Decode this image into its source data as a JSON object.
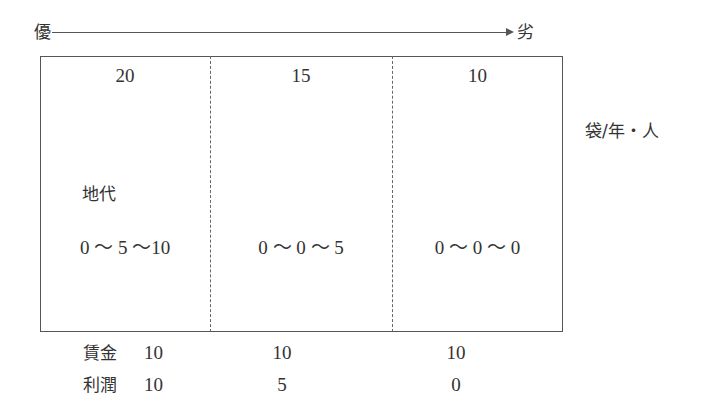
{
  "scale": {
    "left_label": "優",
    "right_label": "劣"
  },
  "unit": "袋/年・人",
  "columns": [
    {
      "yield": "20",
      "rent_range": "0 ～ 5 ～10",
      "wage": "10",
      "profit": "10"
    },
    {
      "yield": "15",
      "rent_range": "0 ～ 0 ～ 5",
      "wage": "10",
      "profit": "5"
    },
    {
      "yield": "10",
      "rent_range": "0 ～ 0 ～ 0",
      "wage": "10",
      "profit": "0"
    }
  ],
  "labels": {
    "rent": "地代",
    "wage": "賃金",
    "profit": "利潤"
  },
  "colors": {
    "line": "#555555",
    "text": "#333333",
    "background": "#ffffff"
  }
}
